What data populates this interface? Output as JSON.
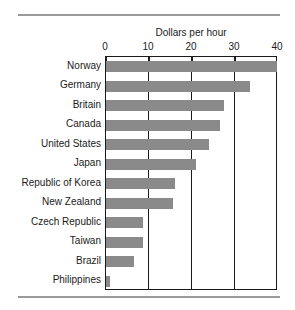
{
  "chart_data": {
    "type": "bar",
    "orientation": "horizontal",
    "title": "Dollars per hour",
    "xlabel": "",
    "ylabel": "",
    "xlim": [
      0,
      40
    ],
    "xticks": [
      0,
      10,
      20,
      30,
      40
    ],
    "xtick_labels": [
      "0",
      "10",
      "20",
      "30",
      "40"
    ],
    "grid": true,
    "legend": false,
    "bar_color": "#8a8a8a",
    "categories": [
      "Norway",
      "Germany",
      "Britain",
      "Canada",
      "United States",
      "Japan",
      "Republic of Korea",
      "New Zealand",
      "Czech Republic",
      "Taiwan",
      "Brazil",
      "Philippines"
    ],
    "values": [
      39.8,
      33.5,
      27.5,
      26.5,
      24.0,
      21.0,
      16.0,
      15.5,
      8.5,
      8.5,
      6.5,
      1.0
    ]
  }
}
